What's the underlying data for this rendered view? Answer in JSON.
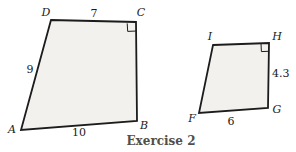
{
  "caption": "Exercise 2",
  "colors": {
    "outline": "#1c1c1c",
    "fill": "#f2f1ee",
    "label": "#1a1a1a",
    "caption": "#524e49"
  },
  "left_quadrilateral": {
    "vertex_labels": {
      "A": "A",
      "B": "B",
      "C": "C",
      "D": "D"
    },
    "side_labels": {
      "top": "7",
      "left": "9",
      "bottom": "10"
    },
    "right_angle_vertex": "C"
  },
  "right_quadrilateral": {
    "vertex_labels": {
      "F": "F",
      "G": "G",
      "H": "H",
      "I": "I"
    },
    "side_labels": {
      "right": "4.3",
      "bottom": "6"
    },
    "right_angle_vertex": "H"
  }
}
